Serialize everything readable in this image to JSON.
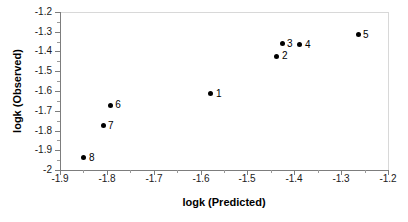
{
  "chart_data": {
    "type": "scatter",
    "title": "",
    "xlabel": "logk (Predicted)",
    "ylabel": "logk (Observed)",
    "xlim": [
      -1.9,
      -1.2
    ],
    "ylim": [
      -2.0,
      -1.2
    ],
    "xticks": [
      "-1.9",
      "-1.8",
      "-1.7",
      "-1.6",
      "-1.5",
      "-1.4",
      "-1.3",
      "-1.2"
    ],
    "xtick_values": [
      -1.9,
      -1.8,
      -1.7,
      -1.6,
      -1.5,
      -1.4,
      -1.3,
      -1.2
    ],
    "yticks": [
      "-1.2",
      "-1.3",
      "-1.4",
      "-1.5",
      "-1.6",
      "-1.7",
      "-1.8",
      "-1.9",
      "-2"
    ],
    "ytick_values": [
      -1.2,
      -1.3,
      -1.4,
      -1.5,
      -1.6,
      -1.7,
      -1.8,
      -1.9,
      -2.0
    ],
    "grid": false,
    "legend": false,
    "minor_ticks": true,
    "marker": "filled-circle",
    "marker_color": "#000000",
    "points": [
      {
        "label": "1",
        "x": -1.578,
        "y": -1.615
      },
      {
        "label": "2",
        "x": -1.437,
        "y": -1.423
      },
      {
        "label": "3",
        "x": -1.426,
        "y": -1.362
      },
      {
        "label": "4",
        "x": -1.388,
        "y": -1.367
      },
      {
        "label": "5",
        "x": -1.264,
        "y": -1.316
      },
      {
        "label": "6",
        "x": -1.793,
        "y": -1.671
      },
      {
        "label": "7",
        "x": -1.808,
        "y": -1.777
      },
      {
        "label": "8",
        "x": -1.849,
        "y": -1.939
      }
    ]
  }
}
